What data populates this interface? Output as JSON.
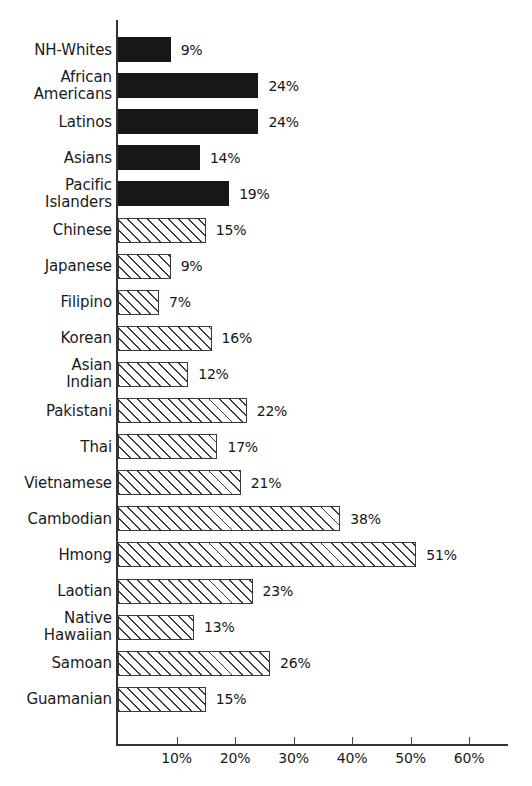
{
  "chart_data": {
    "type": "bar",
    "orientation": "horizontal",
    "title": "",
    "xlabel": "",
    "ylabel": "",
    "xlim": [
      0,
      67
    ],
    "grid": false,
    "legend": false,
    "value_suffix": "%",
    "xticks": [
      "10%",
      "20%",
      "30%",
      "40%",
      "50%",
      "60%"
    ],
    "xtick_values": [
      10,
      20,
      30,
      40,
      50,
      60
    ],
    "categories": [
      "NH-Whites",
      "African\nAmericans",
      "Latinos",
      "Asians",
      "Pacific\nIslanders",
      "Chinese",
      "Japanese",
      "Filipino",
      "Korean",
      "Asian\nIndian",
      "Pakistani",
      "Thai",
      "Vietnamese",
      "Cambodian",
      "Hmong",
      "Laotian",
      "Native\nHawaiian",
      "Samoan",
      "Guamanian"
    ],
    "values": [
      9,
      24,
      24,
      14,
      19,
      15,
      9,
      7,
      16,
      12,
      22,
      17,
      21,
      38,
      51,
      23,
      13,
      26,
      15
    ],
    "value_labels": [
      "9%",
      "24%",
      "24%",
      "14%",
      "19%",
      "15%",
      "9%",
      "7%",
      "16%",
      "12%",
      "22%",
      "17%",
      "21%",
      "38%",
      "51%",
      "23%",
      "13%",
      "26%",
      "15%"
    ],
    "bar_styles": [
      "solid",
      "solid",
      "solid",
      "solid",
      "solid",
      "hatched",
      "hatched",
      "hatched",
      "hatched",
      "hatched",
      "hatched",
      "hatched",
      "hatched",
      "hatched",
      "hatched",
      "hatched",
      "hatched",
      "hatched",
      "hatched"
    ],
    "colors": {
      "solid_bar": "#171717",
      "hatched_bar_line": "#3d3d3d",
      "hatched_bar_fill": "#ffffff",
      "axis": "#333333",
      "text": "#1a1a1a",
      "background": "#ffffff"
    }
  }
}
